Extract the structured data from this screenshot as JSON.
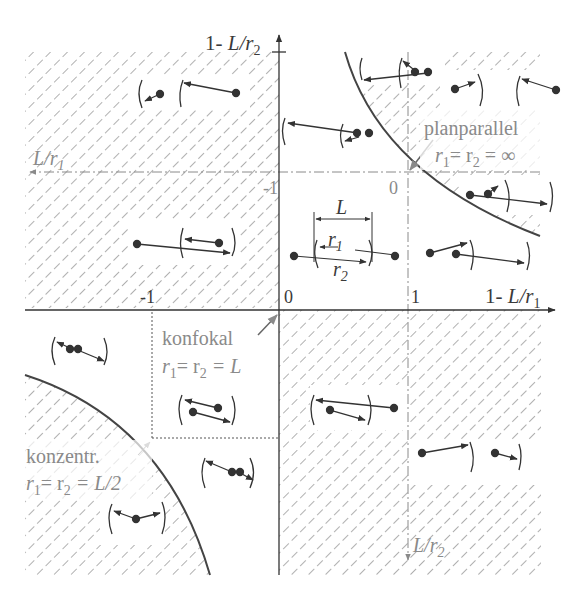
{
  "diagram": {
    "axes": {
      "x_axis_label_prefix": "1- ",
      "x_axis_label_var": "L/r",
      "x_axis_label_sub": "1",
      "y_axis_label_prefix": "1- ",
      "y_axis_label_var": "L/r",
      "y_axis_label_sub": "2",
      "aux_x_label_var": "L/r",
      "aux_x_label_sub": "1",
      "aux_y_label_var": "L/r",
      "aux_y_label_sub": "2",
      "tick_x_0": "0",
      "tick_x_1": "1",
      "tick_x_minus1": "-1",
      "tick_aux_minus1": "-1",
      "tick_aux_0": "0"
    },
    "inset": {
      "L_label": "L",
      "r1_var": "r",
      "r1_sub": "1",
      "r2_var": "r",
      "r2_sub": "2"
    },
    "annotations": {
      "planparallel": {
        "title": "planparallel",
        "eq_r1": "r",
        "eq_r1_sub": "1",
        "eq_mid": "= r",
        "eq_r2_sub": "2",
        "eq_end": " = ∞"
      },
      "konfokal": {
        "title": "konfokal",
        "eq_r1": "r",
        "eq_r1_sub": "1",
        "eq_mid": "= r",
        "eq_r2_sub": "2",
        "eq_end": " = L"
      },
      "konzentrisch": {
        "title": "konzentr.",
        "eq_r1": "r",
        "eq_r1_sub": "1",
        "eq_mid": "= r",
        "eq_r2_sub": "2",
        "eq_end": " = L/2"
      }
    },
    "regions": {
      "stable": "white (unhatched)",
      "unstable": "hatched"
    },
    "colors": {
      "ink": "#333333",
      "gray_axis": "#8a8a8a",
      "hatch": "#7a7a7a",
      "background": "#ffffff"
    }
  }
}
